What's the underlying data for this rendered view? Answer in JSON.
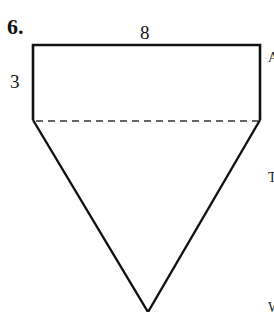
{
  "problem": {
    "number": "6.",
    "labels": {
      "top_width": "8",
      "rect_height": "3"
    }
  },
  "figure": {
    "shape": "rectangle on top of inverted triangle",
    "rectangle": {
      "width": 8,
      "height": 3
    },
    "divider": "dashed line",
    "stroke_color": "#111111"
  },
  "cropped_text_edge": [
    "A",
    "T",
    "W"
  ]
}
